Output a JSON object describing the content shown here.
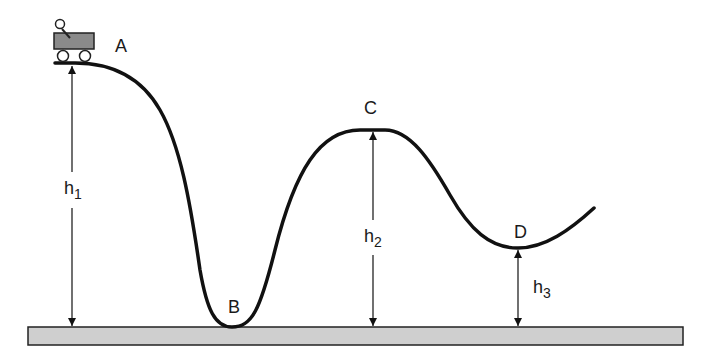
{
  "diagram": {
    "type": "roller-coaster-energy",
    "points": {
      "A": {
        "label": "A"
      },
      "B": {
        "label": "B"
      },
      "C": {
        "label": "C"
      },
      "D": {
        "label": "D"
      }
    },
    "heights": {
      "h1": {
        "base": "h",
        "sub": "1"
      },
      "h2": {
        "base": "h",
        "sub": "2"
      },
      "h3": {
        "base": "h",
        "sub": "3"
      }
    },
    "colors": {
      "track": "#111111",
      "ground_fill": "#cfcfcf",
      "ground_stroke": "#222222",
      "cart_body": "#8a8a8a",
      "arrow": "#111111",
      "text": "#1a1a1a"
    }
  }
}
